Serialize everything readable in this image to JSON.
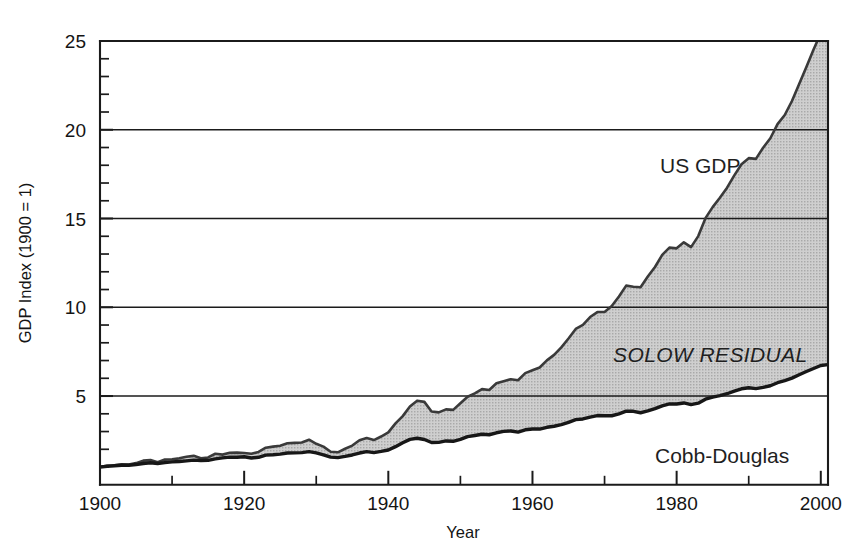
{
  "figure": {
    "background_color": "#ffffff",
    "fill_color": "#c6c6c6",
    "line_color": "#171717"
  },
  "axes": {
    "y_title": "GDP Index (1900 = 1)",
    "x_title": "Year",
    "y_ticks": [
      "5",
      "10",
      "15",
      "20",
      "25"
    ],
    "x_ticks": [
      "1900",
      "1920",
      "1940",
      "1960",
      "1980",
      "2000"
    ]
  },
  "annotations": {
    "us_gdp": "US GDP",
    "solow_residual": "SOLOW RESIDUAL",
    "cobb_douglas": "Cobb-Douglas"
  },
  "chart_data": {
    "type": "area",
    "title": "",
    "subtitle": "",
    "xlabel": "Year",
    "ylabel": "GDP Index (1900 = 1)",
    "xlim": [
      1900,
      2001
    ],
    "ylim": [
      0,
      25
    ],
    "grid": "horizontal-major-only",
    "legend": "inline-annotations",
    "y_major_ticks": [
      5,
      10,
      15,
      20,
      25
    ],
    "y_minor_tick_step": 1,
    "x_major_ticks": [
      1900,
      1920,
      1940,
      1960,
      1980,
      2000
    ],
    "x_minor_ticks": [
      1910,
      1930,
      1950,
      1970,
      1990
    ],
    "annotations": [
      {
        "text": "US GDP",
        "x": 1975,
        "y": 17.3
      },
      {
        "text": "SOLOW RESIDUAL",
        "x": 1973,
        "y": 6.9
      },
      {
        "text": "Cobb-Douglas",
        "x": 1985,
        "y": 2.2
      }
    ],
    "series": [
      {
        "name": "US GDP",
        "note": "upper boundary of shaded region; total real GDP index, 1900 = 1",
        "x": [
          1900,
          1901,
          1902,
          1903,
          1904,
          1905,
          1906,
          1907,
          1908,
          1909,
          1910,
          1911,
          1912,
          1913,
          1914,
          1915,
          1916,
          1917,
          1918,
          1919,
          1920,
          1921,
          1922,
          1923,
          1924,
          1925,
          1926,
          1927,
          1928,
          1929,
          1930,
          1931,
          1932,
          1933,
          1934,
          1935,
          1936,
          1937,
          1938,
          1939,
          1940,
          1941,
          1942,
          1943,
          1944,
          1945,
          1946,
          1947,
          1948,
          1949,
          1950,
          1951,
          1952,
          1953,
          1954,
          1955,
          1956,
          1957,
          1958,
          1959,
          1960,
          1961,
          1962,
          1963,
          1964,
          1965,
          1966,
          1967,
          1968,
          1969,
          1970,
          1971,
          1972,
          1973,
          1974,
          1975,
          1976,
          1977,
          1978,
          1979,
          1980,
          1981,
          1982,
          1983,
          1984,
          1985,
          1986,
          1987,
          1988,
          1989,
          1990,
          1991,
          1992,
          1993,
          1994,
          1995,
          1996,
          1997,
          1998,
          1999,
          2000,
          2001
        ],
        "values": [
          1.0,
          1.08,
          1.1,
          1.15,
          1.14,
          1.22,
          1.36,
          1.39,
          1.27,
          1.42,
          1.44,
          1.49,
          1.58,
          1.63,
          1.5,
          1.54,
          1.75,
          1.7,
          1.8,
          1.81,
          1.79,
          1.75,
          1.85,
          2.09,
          2.15,
          2.2,
          2.34,
          2.36,
          2.38,
          2.54,
          2.31,
          2.15,
          1.86,
          1.83,
          2.03,
          2.21,
          2.51,
          2.64,
          2.52,
          2.72,
          2.95,
          3.46,
          3.87,
          4.41,
          4.74,
          4.67,
          4.13,
          4.08,
          4.25,
          4.22,
          4.59,
          4.96,
          5.15,
          5.39,
          5.34,
          5.72,
          5.84,
          5.95,
          5.89,
          6.29,
          6.45,
          6.61,
          7.01,
          7.32,
          7.74,
          8.24,
          8.78,
          9.01,
          9.45,
          9.73,
          9.74,
          10.07,
          10.61,
          11.22,
          11.16,
          11.13,
          11.73,
          12.27,
          12.95,
          13.36,
          13.32,
          13.66,
          13.39,
          14.01,
          15.02,
          15.64,
          16.17,
          16.74,
          17.43,
          18.06,
          18.4,
          18.36,
          18.99,
          19.52,
          20.32,
          20.83,
          21.62,
          22.58,
          23.53,
          24.52,
          25.44,
          25.53
        ]
      },
      {
        "name": "Cobb-Douglas",
        "note": "lower boundary of shaded region; predicted output from measured capital and labor inputs",
        "x": [
          1900,
          1901,
          1902,
          1903,
          1904,
          1905,
          1906,
          1907,
          1908,
          1909,
          1910,
          1911,
          1912,
          1913,
          1914,
          1915,
          1916,
          1917,
          1918,
          1919,
          1920,
          1921,
          1922,
          1923,
          1924,
          1925,
          1926,
          1927,
          1928,
          1929,
          1930,
          1931,
          1932,
          1933,
          1934,
          1935,
          1936,
          1937,
          1938,
          1939,
          1940,
          1941,
          1942,
          1943,
          1944,
          1945,
          1946,
          1947,
          1948,
          1949,
          1950,
          1951,
          1952,
          1953,
          1954,
          1955,
          1956,
          1957,
          1958,
          1959,
          1960,
          1961,
          1962,
          1963,
          1964,
          1965,
          1966,
          1967,
          1968,
          1969,
          1970,
          1971,
          1972,
          1973,
          1974,
          1975,
          1976,
          1977,
          1978,
          1979,
          1980,
          1981,
          1982,
          1983,
          1984,
          1985,
          1986,
          1987,
          1988,
          1989,
          1990,
          1991,
          1992,
          1993,
          1994,
          1995,
          1996,
          1997,
          1998,
          1999,
          2000,
          2001
        ],
        "values": [
          1.0,
          1.04,
          1.07,
          1.1,
          1.1,
          1.14,
          1.2,
          1.24,
          1.2,
          1.25,
          1.29,
          1.31,
          1.35,
          1.39,
          1.37,
          1.38,
          1.46,
          1.52,
          1.56,
          1.55,
          1.58,
          1.51,
          1.55,
          1.67,
          1.69,
          1.73,
          1.79,
          1.8,
          1.81,
          1.87,
          1.8,
          1.69,
          1.56,
          1.53,
          1.6,
          1.68,
          1.79,
          1.87,
          1.81,
          1.88,
          1.96,
          2.15,
          2.37,
          2.56,
          2.62,
          2.55,
          2.38,
          2.39,
          2.47,
          2.45,
          2.56,
          2.71,
          2.78,
          2.85,
          2.82,
          2.93,
          3.01,
          3.03,
          2.97,
          3.1,
          3.14,
          3.14,
          3.24,
          3.3,
          3.39,
          3.52,
          3.67,
          3.71,
          3.81,
          3.9,
          3.89,
          3.89,
          4.0,
          4.15,
          4.14,
          4.06,
          4.16,
          4.29,
          4.45,
          4.56,
          4.55,
          4.61,
          4.52,
          4.6,
          4.82,
          4.94,
          5.02,
          5.13,
          5.28,
          5.41,
          5.47,
          5.42,
          5.49,
          5.58,
          5.75,
          5.87,
          6.01,
          6.2,
          6.38,
          6.55,
          6.72,
          6.77
        ]
      }
    ],
    "shaded_region": {
      "name": "Solow residual",
      "between": [
        "Cobb-Douglas",
        "US GDP"
      ],
      "color": "#c6c6c6"
    }
  }
}
